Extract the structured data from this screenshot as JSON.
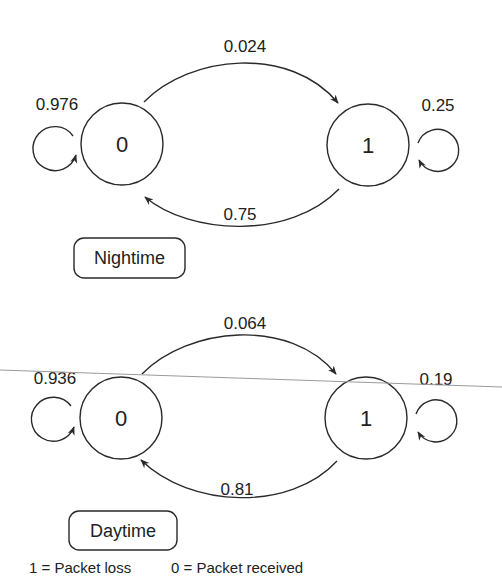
{
  "diagrams": [
    {
      "title": "Nightime",
      "states": [
        {
          "id": "0",
          "label": "0"
        },
        {
          "id": "1",
          "label": "1"
        }
      ],
      "transitions": {
        "p00": "0.976",
        "p01": "0.024",
        "p10": "0.75",
        "p11": "0.25"
      }
    },
    {
      "title": "Daytime",
      "states": [
        {
          "id": "0",
          "label": "0"
        },
        {
          "id": "1",
          "label": "1"
        }
      ],
      "transitions": {
        "p00": "0.936",
        "p01": "0.064",
        "p10": "0.81",
        "p11": "0.19"
      }
    }
  ],
  "legend": {
    "loss": "1 = Packet loss",
    "received": "0 = Packet received"
  },
  "colors": {
    "stroke": "#2a2a2a",
    "scan_line": "#9a9a9a"
  }
}
